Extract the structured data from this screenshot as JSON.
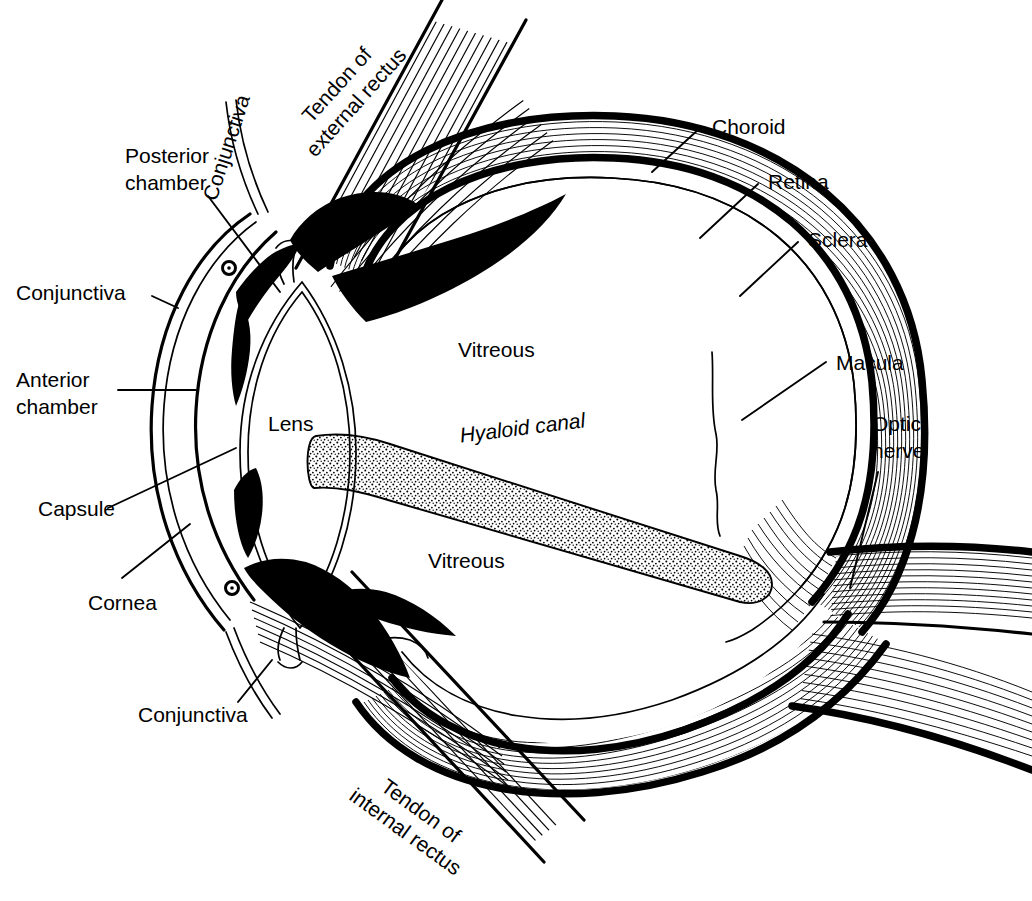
{
  "figure": {
    "ink_color": "#000000",
    "background_color": "#ffffff"
  },
  "labels": {
    "tendon_external_rectus": "Tendon of\nexternal rectus",
    "tendon_external_rectus_line1": "Tendon of",
    "tendon_external_rectus_line2": "external rectus",
    "conjunctiva_upper": "Conjunctiva",
    "posterior_chamber_line1": "Posterior",
    "posterior_chamber_line2": "chamber",
    "conjunctiva_left": "Conjunctiva",
    "anterior_chamber_line1": "Anterior",
    "anterior_chamber_line2": "chamber",
    "capsule": "Capsule",
    "cornea": "Cornea",
    "conjunctiva_lower": "Conjunctiva",
    "tendon_internal_rectus_line1": "Tendon of",
    "tendon_internal_rectus_line2": "internal rectus",
    "lens": "Lens",
    "vitreous_upper": "Vitreous",
    "vitreous_lower": "Vitreous",
    "hyaloid_canal": "Hyaloid canal",
    "choroid": "Choroid",
    "retina": "Retina",
    "sclera": "Sclera",
    "macula": "Macula",
    "optic_nerve_line1": "Optic",
    "optic_nerve_line2": "nerve"
  }
}
